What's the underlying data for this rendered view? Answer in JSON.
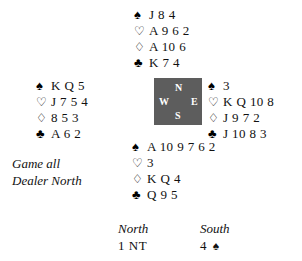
{
  "diagram": {
    "suit_symbols": {
      "spades": "♠",
      "hearts": "♡",
      "diamonds": "♢",
      "clubs": "♣"
    },
    "compass": {
      "north": "N",
      "west": "W",
      "east": "E",
      "south": "S",
      "box_color": "#5d5d5d",
      "label_color": "#ffffff"
    },
    "conditions": {
      "vulnerability": "Game all",
      "dealer": "Dealer North"
    },
    "hands": {
      "north": {
        "seat": "North",
        "spades": "J 8 4",
        "hearts": "A 9 6 2",
        "diamonds": "A 10 6",
        "clubs": "K 7 4"
      },
      "west": {
        "seat": "West",
        "spades": "K Q 5",
        "hearts": "J 7 5 4",
        "diamonds": "8 5 3",
        "clubs": "A 6 2"
      },
      "east": {
        "seat": "East",
        "spades": "3",
        "hearts": "K Q 10 8",
        "diamonds": "J 9 7 2",
        "clubs": "J 10 8 3"
      },
      "south": {
        "seat": "South",
        "spades": "A 10 9 7 6 2",
        "hearts": "3",
        "diamonds": "K Q 4",
        "clubs": "Q 9 5"
      }
    },
    "auction": {
      "columns": [
        {
          "seat": "North",
          "bid_level": "1",
          "bid_denomination": "NT"
        },
        {
          "seat": "South",
          "bid_level": "4",
          "bid_denomination": "♠"
        }
      ]
    }
  }
}
